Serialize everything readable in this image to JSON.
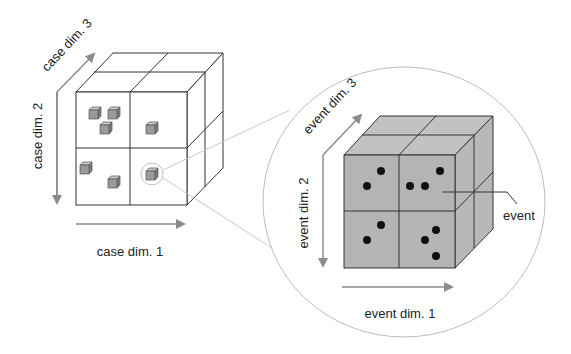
{
  "case_cube": {
    "dim1_label": "case dim. 1",
    "dim2_label": "case dim. 2",
    "dim3_label": "case dim. 3",
    "cells": [
      {
        "position": "top-left",
        "case_count": 3
      },
      {
        "position": "top-right",
        "case_count": 1
      },
      {
        "position": "bottom-left",
        "case_count": 2
      },
      {
        "position": "bottom-right",
        "case_count": 1,
        "highlighted": true
      }
    ]
  },
  "event_cube": {
    "dim1_label": "event dim. 1",
    "dim2_label": "event dim. 2",
    "dim3_label": "event dim. 3",
    "event_label": "event",
    "cells": [
      {
        "position": "top-left",
        "event_count": 2
      },
      {
        "position": "top-right",
        "event_count": 3
      },
      {
        "position": "bottom-left",
        "event_count": 2
      },
      {
        "position": "bottom-right",
        "event_count": 3
      }
    ]
  },
  "colors": {
    "line": "#333333",
    "arrow": "#8c8c8c",
    "cube_fill": "#b4b4b4",
    "small_cube": "#9a9a9a",
    "callout": "#c8c8c8",
    "dot": "#111111"
  }
}
